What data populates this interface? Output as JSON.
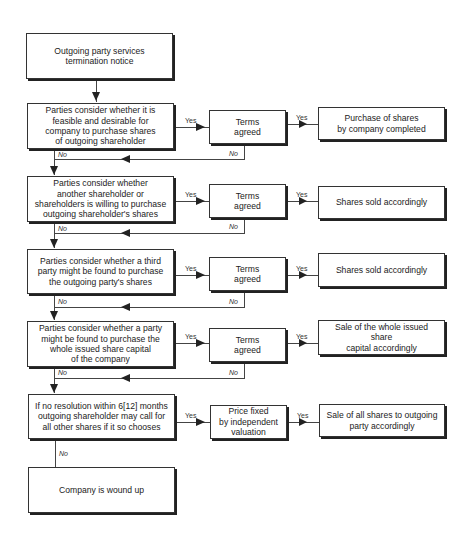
{
  "diagram": {
    "type": "flowchart",
    "start": {
      "text": "Outgoing party services\ntermination notice"
    },
    "rows": [
      {
        "decision": "Parties consider whether it is\nfeasible and desirable for\ncompany to purchase shares\nof outgoing shareholder",
        "middle": "Terms\nagreed",
        "result": "Purchase of shares\nby company completed",
        "yes_label": "Yes",
        "no_label": "No"
      },
      {
        "decision": "Parties consider whether\nanother shareholder or\nshareholders is willing to purchase\noutgoing shareholder's shares",
        "middle": "Terms\nagreed",
        "result": "Shares sold accordingly",
        "yes_label": "Yes",
        "no_label": "No"
      },
      {
        "decision": "Parties consider whether a third\nparty might be found to purchase\nthe outgoing party's shares",
        "middle": "Terms\nagreed",
        "result": "Shares sold accordingly",
        "yes_label": "Yes",
        "no_label": "No"
      },
      {
        "decision": "Parties consider whether a party\nmight be found to purchase the\nwhole issued share capital\nof the company",
        "middle": "Terms\nagreed",
        "result": "Sale of the whole issued share\ncapital accordingly",
        "yes_label": "Yes",
        "no_label": "No"
      },
      {
        "decision": "If no resolution within 6[12] months\noutgoing shareholder may call for\nall other shares if it so chooses",
        "middle": "Price fixed\nby independent\nvaluation",
        "result": "Sale of all shares to outgoing\nparty accordingly",
        "yes_label": "Yes",
        "no_label": "No"
      }
    ],
    "end": {
      "text": "Company is wound up"
    }
  }
}
